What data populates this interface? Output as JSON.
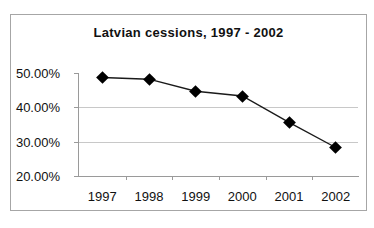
{
  "chart_data": {
    "type": "line",
    "title": "Latvian cessions, 1997 - 2002",
    "xlabel": "",
    "ylabel": "",
    "categories": [
      "1997",
      "1998",
      "1999",
      "2000",
      "2001",
      "2002"
    ],
    "values": [
      0.487,
      0.482,
      0.447,
      0.433,
      0.356,
      0.283
    ],
    "value_labels": [
      "48.70%",
      "48.20%",
      "44.70%",
      "43.30%",
      "35.60%",
      "28.30%"
    ],
    "ylim": [
      0.2,
      0.5
    ],
    "ytick_labels": [
      "50.00%",
      "40.00%",
      "30.00%",
      "20.00%"
    ],
    "ytick_values": [
      0.5,
      0.4,
      0.3,
      0.2
    ],
    "grid": true,
    "legend": "none",
    "marker": "diamond",
    "series_color": "#000000",
    "gridline_color": "#c8c8c8",
    "axis_color": "#9a9a9a",
    "plot_border_color": "#a6a6a6"
  },
  "caption": {
    "text": "",
    "visible": false
  }
}
